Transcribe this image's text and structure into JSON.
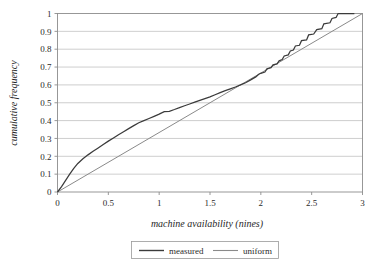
{
  "chart_data": {
    "type": "line",
    "title": "",
    "xlabel": "machine availability (nines)",
    "ylabel": "cumulative frequency",
    "xlim": [
      0,
      3
    ],
    "ylim": [
      0,
      1
    ],
    "xticks": [
      "0",
      "0.5",
      "1",
      "1.5",
      "2",
      "2.5",
      "3"
    ],
    "xtick_values": [
      0,
      0.5,
      1,
      1.5,
      2,
      2.5,
      3
    ],
    "yticks": [
      "0",
      "0.1",
      "0.2",
      "0.3",
      "0.4",
      "0.5",
      "0.6",
      "0.7",
      "0.8",
      "0.9",
      "1"
    ],
    "ytick_values": [
      0,
      0.1,
      0.2,
      0.3,
      0.4,
      0.5,
      0.6,
      0.7,
      0.8,
      0.9,
      1.0
    ],
    "grid": "horizontal",
    "legend_position": "below",
    "series": [
      {
        "name": "measured",
        "color": "#3b3b3b",
        "points": [
          [
            0.0,
            0.0
          ],
          [
            0.04,
            0.03
          ],
          [
            0.08,
            0.065
          ],
          [
            0.12,
            0.1
          ],
          [
            0.16,
            0.132
          ],
          [
            0.2,
            0.16
          ],
          [
            0.25,
            0.186
          ],
          [
            0.3,
            0.208
          ],
          [
            0.35,
            0.228
          ],
          [
            0.4,
            0.247
          ],
          [
            0.45,
            0.266
          ],
          [
            0.5,
            0.285
          ],
          [
            0.55,
            0.303
          ],
          [
            0.6,
            0.321
          ],
          [
            0.65,
            0.338
          ],
          [
            0.7,
            0.355
          ],
          [
            0.75,
            0.372
          ],
          [
            0.8,
            0.388
          ],
          [
            0.85,
            0.4
          ],
          [
            0.9,
            0.412
          ],
          [
            0.95,
            0.424
          ],
          [
            1.0,
            0.436
          ],
          [
            1.05,
            0.45
          ],
          [
            1.1,
            0.452
          ],
          [
            1.15,
            0.462
          ],
          [
            1.2,
            0.473
          ],
          [
            1.25,
            0.483
          ],
          [
            1.3,
            0.493
          ],
          [
            1.35,
            0.503
          ],
          [
            1.4,
            0.513
          ],
          [
            1.45,
            0.523
          ],
          [
            1.5,
            0.533
          ],
          [
            1.55,
            0.545
          ],
          [
            1.6,
            0.557
          ],
          [
            1.65,
            0.568
          ],
          [
            1.7,
            0.578
          ],
          [
            1.75,
            0.588
          ],
          [
            1.8,
            0.6
          ],
          [
            1.85,
            0.612
          ],
          [
            1.9,
            0.628
          ],
          [
            1.95,
            0.645
          ],
          [
            1.98,
            0.66
          ],
          [
            2.0,
            0.665
          ],
          [
            2.04,
            0.672
          ],
          [
            2.06,
            0.69
          ],
          [
            2.1,
            0.697
          ],
          [
            2.12,
            0.712
          ],
          [
            2.16,
            0.718
          ],
          [
            2.18,
            0.735
          ],
          [
            2.21,
            0.742
          ],
          [
            2.23,
            0.762
          ],
          [
            2.27,
            0.768
          ],
          [
            2.29,
            0.79
          ],
          [
            2.32,
            0.795
          ],
          [
            2.34,
            0.818
          ],
          [
            2.38,
            0.822
          ],
          [
            2.4,
            0.848
          ],
          [
            2.45,
            0.852
          ],
          [
            2.47,
            0.88
          ],
          [
            2.52,
            0.885
          ],
          [
            2.55,
            0.91
          ],
          [
            2.6,
            0.915
          ],
          [
            2.62,
            0.942
          ],
          [
            2.68,
            0.948
          ],
          [
            2.7,
            0.972
          ],
          [
            2.74,
            0.978
          ],
          [
            2.76,
            1.0
          ],
          [
            2.92,
            1.0
          ]
        ]
      },
      {
        "name": "uniform",
        "color": "#8a8a8a",
        "points": [
          [
            0.0,
            0.0
          ],
          [
            3.0,
            1.0
          ]
        ]
      }
    ]
  },
  "legend": {
    "items": [
      {
        "label": "measured"
      },
      {
        "label": "uniform"
      }
    ]
  },
  "colors": {
    "measured": "#3b3b3b",
    "uniform": "#8a8a8a",
    "grid": "#b9b9b9",
    "frame": "#8d8d8d",
    "background": "#ffffff"
  }
}
